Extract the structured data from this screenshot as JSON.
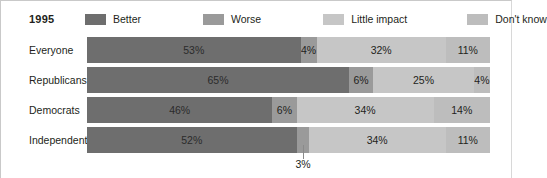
{
  "title": "1995",
  "legend": {
    "position": "top",
    "items": [
      {
        "label": "Better",
        "color": "#6e6e6e",
        "key": "better"
      },
      {
        "label": "Worse",
        "color": "#9a9a9a",
        "key": "worse"
      },
      {
        "label": "Little impact",
        "color": "#c6c6c6",
        "key": "little_impact"
      },
      {
        "label": "Don't know",
        "color": "#bdbdbd",
        "key": "dont_know"
      }
    ]
  },
  "callout": {
    "value_label": "3%",
    "row": "Independents",
    "series": "Worse"
  },
  "chart_data": {
    "type": "bar",
    "orientation": "horizontal",
    "stacked": true,
    "normalized_percent": true,
    "title": "1995",
    "xlabel": "",
    "ylabel": "",
    "xlim": [
      0,
      100
    ],
    "grid": false,
    "legend_position": "top",
    "categories": [
      "Everyone",
      "Republicans",
      "Democrats",
      "Independents"
    ],
    "series": [
      {
        "name": "Better",
        "color": "#6e6e6e",
        "values": [
          53,
          65,
          46,
          52
        ],
        "labels": [
          "53%",
          "65%",
          "46%",
          "52%"
        ]
      },
      {
        "name": "Worse",
        "color": "#9a9a9a",
        "values": [
          4,
          6,
          6,
          3
        ],
        "labels": [
          "4%",
          "6%",
          "6%",
          "3%"
        ]
      },
      {
        "name": "Little impact",
        "color": "#c6c6c6",
        "values": [
          32,
          25,
          34,
          34
        ],
        "labels": [
          "32%",
          "25%",
          "34%",
          "34%"
        ]
      },
      {
        "name": "Don't know",
        "color": "#bdbdbd",
        "values": [
          11,
          4,
          14,
          11
        ],
        "labels": [
          "11%",
          "4%",
          "14%",
          "11%"
        ]
      }
    ],
    "annotations": [
      {
        "text": "3%",
        "category": "Independents",
        "series": "Worse",
        "style": "leader-line-below"
      }
    ]
  },
  "rows": [
    {
      "label": "Everyone",
      "segments": [
        {
          "series": "Better",
          "value": 53,
          "label": "53%",
          "color": "#6e6e6e",
          "show_label": true
        },
        {
          "series": "Worse",
          "value": 4,
          "label": "4%",
          "color": "#9a9a9a",
          "show_label": true
        },
        {
          "series": "Little impact",
          "value": 32,
          "label": "32%",
          "color": "#c6c6c6",
          "show_label": true
        },
        {
          "series": "Don't know",
          "value": 11,
          "label": "11%",
          "color": "#bdbdbd",
          "show_label": true
        }
      ]
    },
    {
      "label": "Republicans",
      "segments": [
        {
          "series": "Better",
          "value": 65,
          "label": "65%",
          "color": "#6e6e6e",
          "show_label": true
        },
        {
          "series": "Worse",
          "value": 6,
          "label": "6%",
          "color": "#9a9a9a",
          "show_label": true
        },
        {
          "series": "Little impact",
          "value": 25,
          "label": "25%",
          "color": "#c6c6c6",
          "show_label": true
        },
        {
          "series": "Don't know",
          "value": 4,
          "label": "4%",
          "color": "#bdbdbd",
          "show_label": true
        }
      ]
    },
    {
      "label": "Democrats",
      "segments": [
        {
          "series": "Better",
          "value": 46,
          "label": "46%",
          "color": "#6e6e6e",
          "show_label": true
        },
        {
          "series": "Worse",
          "value": 6,
          "label": "6%",
          "color": "#9a9a9a",
          "show_label": true
        },
        {
          "series": "Little impact",
          "value": 34,
          "label": "34%",
          "color": "#c6c6c6",
          "show_label": true
        },
        {
          "series": "Don't know",
          "value": 14,
          "label": "14%",
          "color": "#bdbdbd",
          "show_label": true
        }
      ]
    },
    {
      "label": "Independents",
      "segments": [
        {
          "series": "Better",
          "value": 52,
          "label": "52%",
          "color": "#6e6e6e",
          "show_label": true
        },
        {
          "series": "Worse",
          "value": 3,
          "label": "3%",
          "color": "#9a9a9a",
          "show_label": false
        },
        {
          "series": "Little impact",
          "value": 34,
          "label": "34%",
          "color": "#c6c6c6",
          "show_label": true
        },
        {
          "series": "Don't know",
          "value": 11,
          "label": "11%",
          "color": "#bdbdbd",
          "show_label": true
        }
      ]
    }
  ]
}
